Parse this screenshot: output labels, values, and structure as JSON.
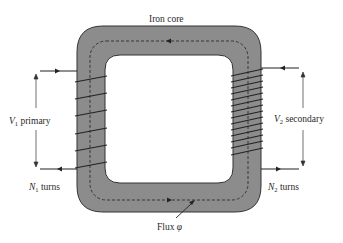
{
  "title": "Iron core",
  "labels": {
    "core": "Iron core",
    "primary_voltage_var": "V",
    "primary_voltage_sub": "1",
    "primary_voltage_text": " primary",
    "secondary_voltage_var": "V",
    "secondary_voltage_sub": "2",
    "secondary_voltage_text": " secondary",
    "primary_turns_var": "N",
    "primary_turns_sub": "1",
    "primary_turns_text": " turns",
    "secondary_turns_var": "N",
    "secondary_turns_sub": "2",
    "secondary_turns_text": " turns",
    "flux": "Flux ",
    "flux_symbol": "φ"
  },
  "diagram": {
    "type": "transformer",
    "core_color": "#8c8c8c",
    "primary_turn_count": 6,
    "secondary_turn_count": 14
  }
}
